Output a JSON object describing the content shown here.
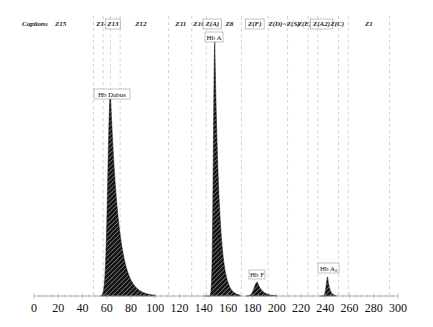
{
  "chart_data": {
    "type": "area",
    "title": "",
    "xlabel": "",
    "ylabel": "",
    "xlim": [
      0,
      300
    ],
    "x_ticks": [
      0,
      20,
      40,
      60,
      80,
      100,
      120,
      140,
      160,
      180,
      200,
      220,
      240,
      260,
      280,
      300
    ],
    "grid": "vertical dashed zone boundaries",
    "caption_header": "Captions",
    "zones": [
      {
        "label": "Z15",
        "center": 22,
        "boxed": false
      },
      {
        "label": "Z14",
        "center": 56,
        "boxed": false
      },
      {
        "label": "Z13",
        "center": 65,
        "boxed": true
      },
      {
        "label": "Z12",
        "center": 88,
        "boxed": false
      },
      {
        "label": "Z11",
        "center": 121,
        "boxed": false
      },
      {
        "label": "Z10",
        "center": 136,
        "boxed": false
      },
      {
        "label": "Z(A)",
        "center": 147,
        "boxed": true
      },
      {
        "label": "Z8",
        "center": 161,
        "boxed": false
      },
      {
        "label": "Z(F)",
        "center": 182,
        "boxed": true
      },
      {
        "label": "Z(D)",
        "center": 199,
        "boxed": false
      },
      {
        "label": "~Z(S)",
        "center": 212,
        "boxed": false
      },
      {
        "label": "Z(E)",
        "center": 223,
        "boxed": false
      },
      {
        "label": "Z(A2)",
        "center": 237,
        "boxed": true
      },
      {
        "label": "Z(C)",
        "center": 250,
        "boxed": false
      },
      {
        "label": "Z1",
        "center": 276,
        "boxed": false
      }
    ],
    "zone_boundaries": [
      49,
      57,
      63,
      71,
      111,
      130,
      142,
      171,
      193,
      209,
      226,
      234,
      251,
      259,
      293
    ],
    "peaks": [
      {
        "name": "Hb Dabus",
        "x": 63,
        "height": 0.8
      },
      {
        "name": "Hb A",
        "x": 149,
        "height": 1.0
      },
      {
        "name": "Hb F",
        "x": 184,
        "height": 0.055
      },
      {
        "name": "Hb A2",
        "x": 242,
        "height": 0.075
      }
    ],
    "fill": "diagonal hatch, black"
  },
  "labels": {
    "captions": "Captions",
    "peak_hb_dabus": "Hb Dabus",
    "peak_hb_a": "Hb A",
    "peak_hb_f": "Hb F",
    "peak_hb_a2_main": "Hb A",
    "peak_hb_a2_sub": "2"
  }
}
